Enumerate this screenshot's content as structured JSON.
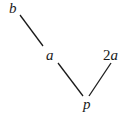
{
  "diagram": {
    "type": "hasse-diagram",
    "nodes": [
      {
        "id": "b",
        "label": "b",
        "x": 14,
        "y": 8
      },
      {
        "id": "a",
        "label": "a",
        "x": 51,
        "y": 55
      },
      {
        "id": "2a",
        "label": "2a",
        "x": 112,
        "y": 55
      },
      {
        "id": "p",
        "label": "p",
        "x": 88,
        "y": 104
      }
    ],
    "edges": [
      {
        "from": "b",
        "to": "a"
      },
      {
        "from": "a",
        "to": "p"
      },
      {
        "from": "2a",
        "to": "p"
      }
    ],
    "line_color": "#1a1a1a",
    "label_color": "#1a1a1a"
  },
  "labels": {
    "b": "b",
    "a": "a",
    "two_a_coef": "2",
    "two_a_var": "a",
    "p": "p"
  }
}
